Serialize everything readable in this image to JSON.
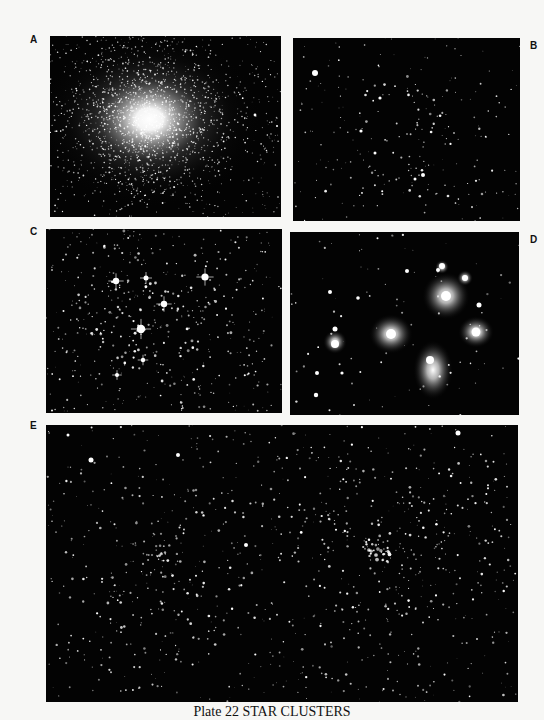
{
  "plate": {
    "caption": "Plate 22 STAR CLUSTERS",
    "background": "#f7f7f5"
  },
  "panels": [
    {
      "label": "A",
      "subject": "globular-cluster",
      "x": 50,
      "y": 36,
      "w": 231,
      "h": 181
    },
    {
      "label": "B",
      "subject": "open-cluster-sparse",
      "x": 293,
      "y": 38,
      "w": 227,
      "h": 183
    },
    {
      "label": "C",
      "subject": "open-cluster-dense",
      "x": 46,
      "y": 229,
      "w": 236,
      "h": 184
    },
    {
      "label": "D",
      "subject": "pleiades-reflection-nebula",
      "x": 290,
      "y": 232,
      "w": 229,
      "h": 183
    },
    {
      "label": "E",
      "subject": "double-cluster",
      "x": 46,
      "y": 425,
      "w": 472,
      "h": 277
    }
  ],
  "colors": {
    "sky": "#030303",
    "star": "#ffffff",
    "nebula": "#c8c8c8"
  }
}
